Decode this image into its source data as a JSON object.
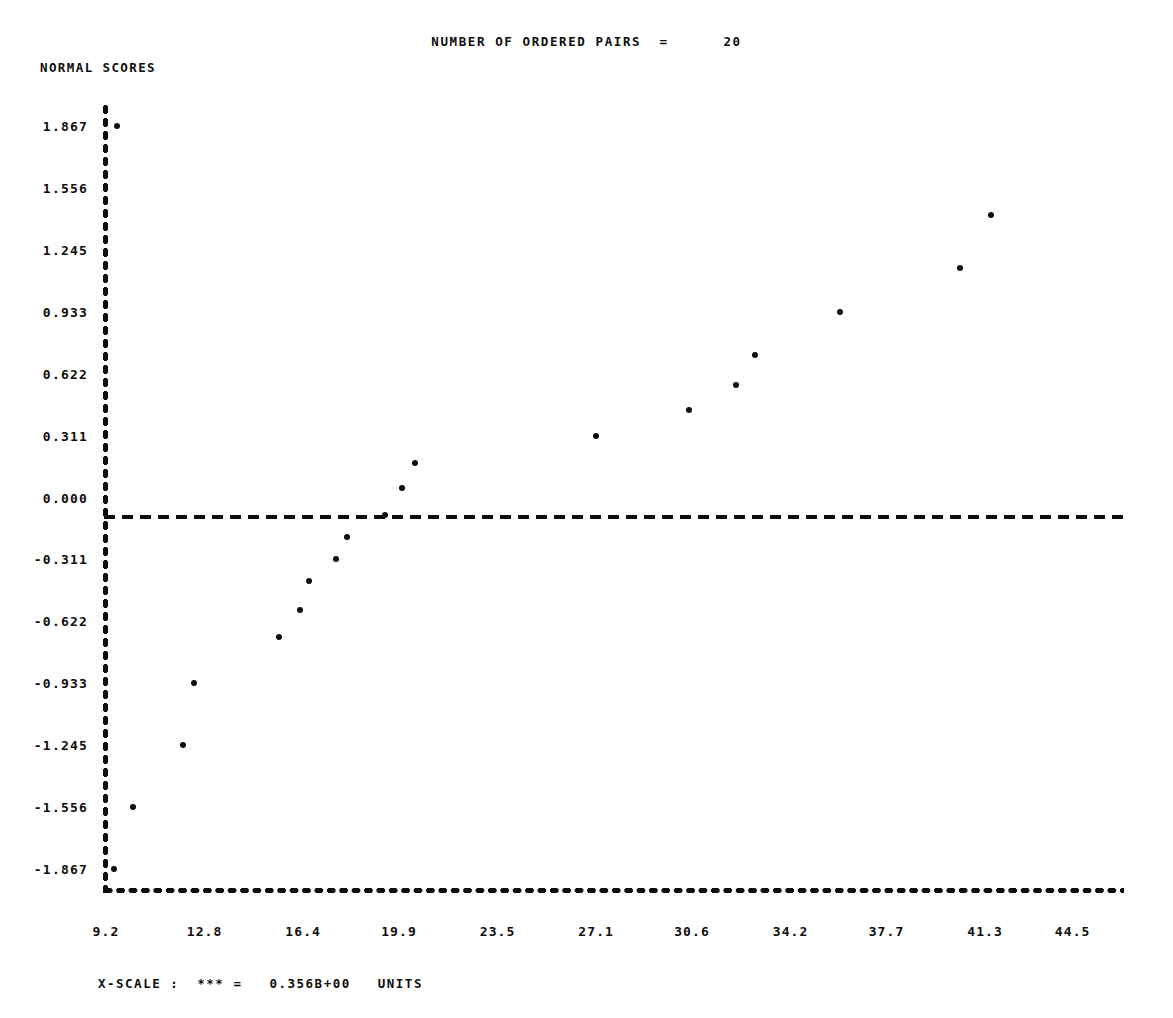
{
  "header": {
    "title": "NUMBER OF ORDERED PAIRS  =      20"
  },
  "axes": {
    "y_title": "NORMAL SCORES"
  },
  "footer": {
    "x_scale_note": "X-SCALE :  *** =   0.356B+00   UNITS"
  },
  "chart_data": {
    "type": "scatter",
    "title": "NUMBER OF ORDERED PAIRS  =      20",
    "xlabel": "",
    "ylabel": "NORMAL SCORES",
    "grid": false,
    "legend": "none",
    "n_ordered_pairs": 20,
    "x_scale_units": "0.356B+00",
    "xlim": [
      9.2,
      46.3
    ],
    "ylim": [
      -1.867,
      1.867
    ],
    "zero_reference_line": 0.0,
    "ytick_labels": [
      "1.867",
      "1.556",
      "1.245",
      "0.933",
      "0.622",
      "0.311",
      "0.000",
      "-0.311",
      "-0.622",
      "-0.933",
      "-1.245",
      "-1.556",
      "-1.867"
    ],
    "ytick_values": [
      1.867,
      1.556,
      1.245,
      0.933,
      0.622,
      0.311,
      0.0,
      -0.311,
      -0.622,
      -0.933,
      -1.245,
      -1.556,
      -1.867
    ],
    "xtick_labels": [
      "9.2",
      "12.8",
      "16.4",
      "19.9",
      "23.5",
      "27.1",
      "30.6",
      "34.2",
      "37.7",
      "41.3",
      "44.5"
    ],
    "xtick_values": [
      9.2,
      12.8,
      16.4,
      19.9,
      23.5,
      27.1,
      30.6,
      34.2,
      37.7,
      41.3,
      44.5
    ],
    "points": [
      {
        "x": 9.5,
        "y": -1.867
      },
      {
        "x": 10.2,
        "y": -1.556
      },
      {
        "x": 12.0,
        "y": -1.245
      },
      {
        "x": 12.4,
        "y": -0.933
      },
      {
        "x": 15.5,
        "y": -0.7
      },
      {
        "x": 16.3,
        "y": -0.566
      },
      {
        "x": 16.6,
        "y": -0.42
      },
      {
        "x": 17.6,
        "y": -0.311
      },
      {
        "x": 18.0,
        "y": -0.2
      },
      {
        "x": 19.4,
        "y": -0.09
      },
      {
        "x": 20.0,
        "y": 0.048
      },
      {
        "x": 20.5,
        "y": 0.175
      },
      {
        "x": 27.1,
        "y": 0.311
      },
      {
        "x": 30.5,
        "y": 0.44
      },
      {
        "x": 32.2,
        "y": 0.565
      },
      {
        "x": 32.9,
        "y": 0.716
      },
      {
        "x": 36.0,
        "y": 0.933
      },
      {
        "x": 40.4,
        "y": 1.155
      },
      {
        "x": 41.5,
        "y": 1.42
      },
      {
        "x": 9.6,
        "y": 1.867
      }
    ]
  }
}
